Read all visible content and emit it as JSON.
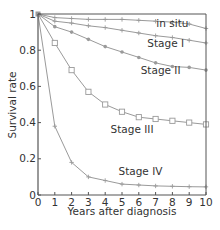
{
  "chart_data": {
    "type": "line",
    "title": "",
    "xlabel": "Years after diagnosis",
    "ylabel": "Survival rate",
    "xlim": [
      0,
      10
    ],
    "ylim": [
      0,
      1
    ],
    "x_ticks": [
      0,
      1,
      2,
      3,
      4,
      5,
      6,
      7,
      8,
      9,
      10
    ],
    "y_ticks": [
      0,
      0.2,
      0.4,
      0.6,
      0.8,
      1
    ],
    "y_tick_labels": [
      "0",
      "0.2",
      "0.4",
      "0.6",
      "0.8",
      "1"
    ],
    "grid": false,
    "legend": "inline labels",
    "x": [
      0,
      1,
      2,
      3,
      4,
      5,
      6,
      7,
      8,
      9,
      10
    ],
    "series": [
      {
        "name": "in situ",
        "marker": "plus",
        "values": [
          1.0,
          0.98,
          0.975,
          0.97,
          0.97,
          0.97,
          0.965,
          0.96,
          0.955,
          0.945,
          0.92
        ]
      },
      {
        "name": "Stage I",
        "marker": "plus",
        "values": [
          1.0,
          0.96,
          0.95,
          0.935,
          0.925,
          0.91,
          0.895,
          0.88,
          0.87,
          0.855,
          0.84
        ]
      },
      {
        "name": "Stage II",
        "marker": "dot",
        "values": [
          1.0,
          0.93,
          0.9,
          0.86,
          0.82,
          0.79,
          0.76,
          0.73,
          0.71,
          0.705,
          0.69
        ]
      },
      {
        "name": "Stage III",
        "marker": "square",
        "values": [
          1.0,
          0.84,
          0.69,
          0.57,
          0.5,
          0.46,
          0.43,
          0.42,
          0.41,
          0.4,
          0.39
        ]
      },
      {
        "name": "Stage IV",
        "marker": "plus",
        "values": [
          1.0,
          0.38,
          0.18,
          0.1,
          0.08,
          0.06,
          0.055,
          0.05,
          0.048,
          0.046,
          0.045
        ]
      }
    ],
    "annotations": [
      {
        "text": "in situ",
        "x": 8.0,
        "y": 0.93
      },
      {
        "text": "Stage I",
        "x": 7.6,
        "y": 0.82
      },
      {
        "text": "Stage II",
        "x": 7.3,
        "y": 0.67
      },
      {
        "text": "Stage III",
        "x": 5.6,
        "y": 0.34
      },
      {
        "text": "Stage IV",
        "x": 6.1,
        "y": 0.11
      }
    ],
    "colors": {
      "line": "#9a9a9a",
      "axis": "#555555",
      "text": "#333333"
    }
  }
}
